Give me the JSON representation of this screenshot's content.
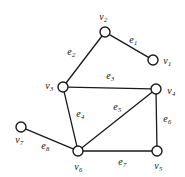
{
  "figure": {
    "background_color": "#ffffff",
    "stroke_color": "#1a1a1a",
    "width": 185,
    "height": 177
  },
  "chart_data": {
    "type": "diagram",
    "subtype": "undirected-graph",
    "title": "",
    "vertices": [
      {
        "id": "v1",
        "name": "v",
        "index": "1",
        "x": 153,
        "y": 60,
        "label_x": 167,
        "label_y": 61,
        "r": 5
      },
      {
        "id": "v2",
        "name": "v",
        "index": "2",
        "x": 105,
        "y": 32,
        "label_x": 103,
        "label_y": 17,
        "r": 5
      },
      {
        "id": "v3",
        "name": "v",
        "index": "3",
        "x": 63,
        "y": 87,
        "label_x": 49,
        "label_y": 86,
        "r": 5
      },
      {
        "id": "v4",
        "name": "v",
        "index": "4",
        "x": 156,
        "y": 89,
        "label_x": 171,
        "label_y": 91,
        "r": 5
      },
      {
        "id": "v5",
        "name": "v",
        "index": "5",
        "x": 157,
        "y": 151,
        "label_x": 158,
        "label_y": 166,
        "r": 5
      },
      {
        "id": "v6",
        "name": "v",
        "index": "6",
        "x": 78,
        "y": 151,
        "label_x": 78,
        "label_y": 167,
        "r": 5
      },
      {
        "id": "v7",
        "name": "v",
        "index": "7",
        "x": 21,
        "y": 127,
        "label_x": 19,
        "label_y": 140,
        "r": 5
      }
    ],
    "edges": [
      {
        "id": "e1",
        "name": "e",
        "index": "1",
        "from": "v2",
        "to": "v1",
        "label_x": 133,
        "label_y": 40
      },
      {
        "id": "e2",
        "name": "e",
        "index": "2",
        "from": "v3",
        "to": "v2",
        "label_x": 71,
        "label_y": 52
      },
      {
        "id": "e3",
        "name": "e",
        "index": "3",
        "from": "v3",
        "to": "v4",
        "label_x": 110,
        "label_y": 76
      },
      {
        "id": "e4",
        "name": "e",
        "index": "4",
        "from": "v3",
        "to": "v6",
        "label_x": 80,
        "label_y": 114
      },
      {
        "id": "e5",
        "name": "e",
        "index": "5",
        "from": "v6",
        "to": "v4",
        "label_x": 117,
        "label_y": 107
      },
      {
        "id": "e6",
        "name": "e",
        "index": "6",
        "from": "v4",
        "to": "v5",
        "label_x": 167,
        "label_y": 119
      },
      {
        "id": "e7",
        "name": "e",
        "index": "7",
        "from": "v6",
        "to": "v5",
        "label_x": 122,
        "label_y": 162
      },
      {
        "id": "e8",
        "name": "e",
        "index": "8",
        "from": "v7",
        "to": "v6",
        "label_x": 45,
        "label_y": 146
      }
    ],
    "vertex_count": 7,
    "edge_count": 8,
    "grid": false,
    "legend": null
  }
}
